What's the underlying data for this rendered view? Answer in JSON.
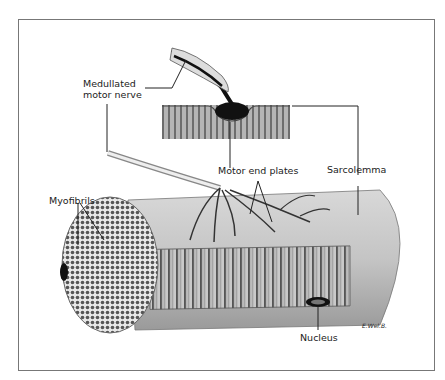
{
  "figure": {
    "labels": {
      "nerve_line1": "Medullated",
      "nerve_line2": "motor nerve",
      "end_plates": "Motor end plates",
      "sarcolemma": "Sarcolemma",
      "myofibrils": "Myofibrils",
      "nucleus": "Nucleus",
      "signature": "E.Wel.B."
    },
    "colors": {
      "frame": "#777777",
      "ink": "#222222",
      "fiber": "#c8c8c8",
      "dark": "#111111"
    }
  }
}
